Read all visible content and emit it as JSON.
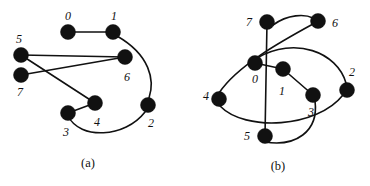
{
  "figure": {
    "title": "",
    "background_color": "#ffffff",
    "node_color": "#111111",
    "edge_color": "#111111",
    "width": 370,
    "height": 186
  },
  "panels": [
    {
      "id": "a",
      "caption": "(a)",
      "caption_x": 88,
      "caption_y": 163,
      "nodes": [
        {
          "id": "0",
          "label": "0",
          "cx": 68,
          "cy": 32,
          "r": 7.5,
          "label_x": 68,
          "label_y": 16
        },
        {
          "id": "1",
          "label": "1",
          "cx": 113,
          "cy": 32,
          "r": 7.5,
          "label_x": 114,
          "label_y": 16
        },
        {
          "id": "5",
          "label": "5",
          "cx": 21,
          "cy": 55,
          "r": 7.5,
          "label_x": 19,
          "label_y": 39
        },
        {
          "id": "6",
          "label": "6",
          "cx": 125,
          "cy": 57,
          "r": 7.5,
          "label_x": 127,
          "label_y": 77
        },
        {
          "id": "7",
          "label": "7",
          "cx": 21,
          "cy": 75,
          "r": 7.5,
          "label_x": 20,
          "label_y": 92
        },
        {
          "id": "4",
          "label": "4",
          "cx": 95,
          "cy": 103,
          "r": 7.5,
          "label_x": 97,
          "label_y": 122
        },
        {
          "id": "2",
          "label": "2",
          "cx": 148,
          "cy": 105,
          "r": 7.5,
          "label_x": 151,
          "label_y": 123
        },
        {
          "id": "3",
          "label": "3",
          "cx": 68,
          "cy": 113,
          "r": 7.5,
          "label_x": 66,
          "label_y": 132
        }
      ],
      "edges": [
        {
          "from": "0",
          "to": "1",
          "kind": "line",
          "path": "M 68 32 L 113 32"
        },
        {
          "from": "1",
          "to": "2",
          "kind": "curve",
          "path": "M 117 36 C 150 55 155 80 149 98"
        },
        {
          "from": "5",
          "to": "6",
          "kind": "line",
          "path": "M 21 55 L 125 57"
        },
        {
          "from": "5",
          "to": "4",
          "kind": "line",
          "path": "M 21 55 L 95 103"
        },
        {
          "from": "7",
          "to": "6",
          "kind": "line",
          "path": "M 21 75 L 125 57"
        },
        {
          "from": "4",
          "to": "3",
          "kind": "line",
          "path": "M 95 103 L 68 113"
        },
        {
          "from": "3",
          "to": "2",
          "kind": "curve",
          "path": "M 68 116 C 80 140 125 138 145 112"
        }
      ]
    },
    {
      "id": "b",
      "caption": "(b)",
      "caption_x": 93,
      "caption_y": 166,
      "nodes": [
        {
          "id": "7",
          "label": "7",
          "cx": 82,
          "cy": 22,
          "r": 7.5,
          "label_x": 64,
          "label_y": 22
        },
        {
          "id": "6",
          "label": "6",
          "cx": 133,
          "cy": 21,
          "r": 7.5,
          "label_x": 150,
          "label_y": 23
        },
        {
          "id": "0",
          "label": "0",
          "cx": 70,
          "cy": 63,
          "r": 7.5,
          "label_x": 70,
          "label_y": 79
        },
        {
          "id": "1",
          "label": "1",
          "cx": 98,
          "cy": 69,
          "r": 7.5,
          "label_x": 97,
          "label_y": 91
        },
        {
          "id": "2",
          "label": "2",
          "cx": 162,
          "cy": 90,
          "r": 7.5,
          "label_x": 167,
          "label_y": 72
        },
        {
          "id": "4",
          "label": "4",
          "cx": 34,
          "cy": 99,
          "r": 7.5,
          "label_x": 21,
          "label_y": 96
        },
        {
          "id": "3",
          "label": "3",
          "cx": 128,
          "cy": 95,
          "r": 7.5,
          "label_x": 126,
          "label_y": 112
        },
        {
          "id": "5",
          "label": "5",
          "cx": 80,
          "cy": 136,
          "r": 7.5,
          "label_x": 62,
          "label_y": 136
        }
      ],
      "edges": [
        {
          "from": "7",
          "to": "5",
          "kind": "line",
          "path": "M 82 22 L 80 136"
        },
        {
          "from": "7",
          "to": "6",
          "kind": "curve",
          "path": "M 88 25 C 103 14 120 14 128 18"
        },
        {
          "from": "6",
          "to": "4",
          "kind": "curve",
          "path": "M 128 24 C 95 42 52 66 34 93"
        },
        {
          "from": "0",
          "to": "1",
          "kind": "line",
          "path": "M 70 63 L 98 69"
        },
        {
          "from": "1",
          "to": "3",
          "kind": "line",
          "path": "M 98 69 L 128 95"
        },
        {
          "from": "0",
          "to": "2",
          "kind": "curve",
          "path": "M 72 58 C 110 36 152 52 161 83"
        },
        {
          "from": "2",
          "to": "4",
          "kind": "curve",
          "path": "M 158 95 C 132 128 60 132 35 106"
        },
        {
          "from": "3",
          "to": "5",
          "kind": "curve",
          "path": "M 130 101 C 134 132 110 147 80 142"
        }
      ]
    }
  ]
}
